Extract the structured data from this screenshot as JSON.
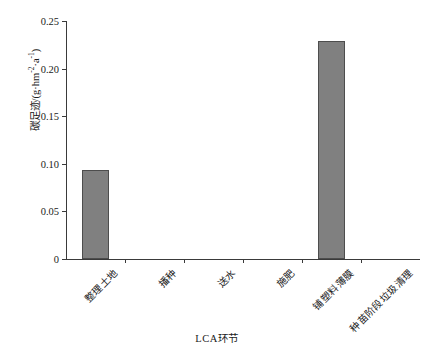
{
  "chart_data": {
    "type": "bar",
    "title": "",
    "xlabel": "LCA环节",
    "ylabel": "碳足迹/(g·hm-2·a-1)",
    "ylabel_parts": {
      "prefix": "碳足迹/(g·hm",
      "sup1": "-2",
      "mid": "·a",
      "sup2": "-1",
      "suffix": ")"
    },
    "categories": [
      "整理土地",
      "播种",
      "送水",
      "施肥",
      "铺塑料薄膜",
      "种苗阶段垃圾清理"
    ],
    "values": [
      0.094,
      0.0,
      0.0,
      0.0,
      0.229,
      0.0
    ],
    "ylim": [
      0,
      0.25
    ],
    "yticks": [
      0,
      0.05,
      0.1,
      0.15,
      0.2,
      0.25
    ],
    "ytick_labels": [
      "0",
      "0.05",
      "0.10",
      "0.15",
      "0.20",
      "0.25"
    ],
    "grid": false,
    "legend": "none",
    "bar_color": "#808080",
    "bar_edge_color": "#4d4d4d",
    "axis_color": "#3a3a3a"
  }
}
